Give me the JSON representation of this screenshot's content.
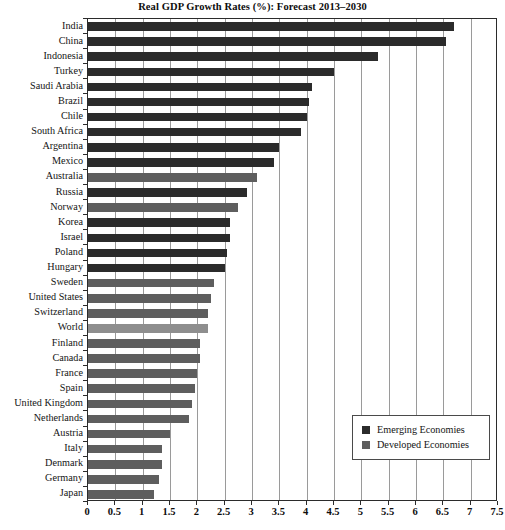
{
  "chart_data": {
    "type": "bar",
    "orientation": "horizontal",
    "title": "Real GDP Growth Rates (%): Forecast 2013–2030",
    "xlabel": "",
    "ylabel": "",
    "xlim": [
      0,
      7.5
    ],
    "xticks": [
      "0",
      "0.5",
      "1",
      "1.5",
      "2",
      "2.5",
      "3",
      "3.5",
      "4",
      "4.5",
      "5",
      "5.5",
      "6",
      "6.5",
      "7",
      "7.5"
    ],
    "xtick_values": [
      0,
      0.5,
      1,
      1.5,
      2,
      2.5,
      3,
      3.5,
      4,
      4.5,
      5,
      5.5,
      6,
      6.5,
      7,
      7.5
    ],
    "grid": true,
    "grid_axis": "x",
    "legend_position": "bottom-right",
    "legend": [
      {
        "name": "Emerging Economies",
        "color": "#2b2b2b"
      },
      {
        "name": "Developed Economies",
        "color": "#5e5e5e"
      }
    ],
    "categories": [
      "India",
      "China",
      "Indonesia",
      "Turkey",
      "Saudi Arabia",
      "Brazil",
      "Chile",
      "South Africa",
      "Argentina",
      "Mexico",
      "Australia",
      "Russia",
      "Norway",
      "Korea",
      "Israel",
      "Poland",
      "Hungary",
      "Sweden",
      "United States",
      "Switzerland",
      "World",
      "Finland",
      "Canada",
      "France",
      "Spain",
      "United Kingdom",
      "Netherlands",
      "Austria",
      "Italy",
      "Denmark",
      "Germany",
      "Japan"
    ],
    "values": [
      6.7,
      6.55,
      5.3,
      4.5,
      4.1,
      4.05,
      4.0,
      3.9,
      3.5,
      3.4,
      3.1,
      2.9,
      2.75,
      2.6,
      2.6,
      2.55,
      2.5,
      2.3,
      2.25,
      2.2,
      2.2,
      2.05,
      2.05,
      2.0,
      1.95,
      1.9,
      1.85,
      1.5,
      1.35,
      1.35,
      1.3,
      1.2
    ],
    "groups": [
      "emerging",
      "emerging",
      "emerging",
      "emerging",
      "emerging",
      "emerging",
      "emerging",
      "emerging",
      "emerging",
      "emerging",
      "developed",
      "emerging",
      "developed",
      "emerging",
      "emerging",
      "emerging",
      "emerging",
      "developed",
      "developed",
      "developed",
      "world",
      "developed",
      "developed",
      "developed",
      "developed",
      "developed",
      "developed",
      "developed",
      "developed",
      "developed",
      "developed",
      "developed"
    ]
  }
}
